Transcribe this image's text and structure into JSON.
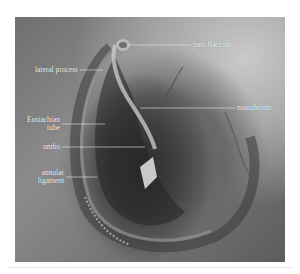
{
  "figure": {
    "labels": [
      {
        "id": "pars-flaccida",
        "text": "pars flaccida"
      },
      {
        "id": "lateral-process",
        "text": "lateral process"
      },
      {
        "id": "manubrium",
        "text": "manubrium"
      },
      {
        "id": "eustachian-tube",
        "text_line1": "Eustachian",
        "text_line2": "tube"
      },
      {
        "id": "umbo",
        "text": "umbo"
      },
      {
        "id": "annular-ligament",
        "text_line1": "annular",
        "text_line2": "ligament"
      }
    ],
    "colors": {
      "label_text": "#f4f4f4",
      "leader_line": "#e8e8e8",
      "background": "#ffffff"
    }
  }
}
